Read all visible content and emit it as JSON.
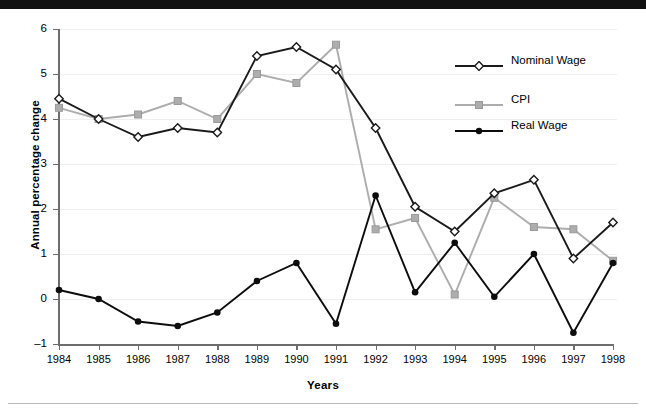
{
  "chart_data": {
    "type": "line",
    "title": "",
    "xlabel": "Years",
    "ylabel": "Annual percentage change",
    "grid": true,
    "legend_position": "top-right",
    "categories": [
      "1984",
      "1985",
      "1986",
      "1987",
      "1988",
      "1989",
      "1990",
      "1991",
      "1992",
      "1993",
      "1994",
      "1995",
      "1996",
      "1997",
      "1998"
    ],
    "x": [
      1984,
      1985,
      1986,
      1987,
      1988,
      1989,
      1990,
      1991,
      1992,
      1993,
      1994,
      1995,
      1996,
      1997,
      1998
    ],
    "xlim": [
      1984,
      1998
    ],
    "ylim": [
      -1,
      6
    ],
    "ytick_labels": [
      "6",
      "5",
      "4",
      "3",
      "2",
      "1",
      "0",
      "–1"
    ],
    "ytick_values": [
      6,
      5,
      4,
      3,
      2,
      1,
      0,
      -1
    ],
    "series": [
      {
        "name": "Nominal Wage",
        "marker": "diamond-open",
        "color": "#1a1a1a",
        "values": [
          4.45,
          4.0,
          3.6,
          3.8,
          3.7,
          5.4,
          5.6,
          5.1,
          3.8,
          2.05,
          1.5,
          2.35,
          2.65,
          0.9,
          1.7
        ]
      },
      {
        "name": "CPI",
        "marker": "square-filled",
        "color": "#adadad",
        "values": [
          4.25,
          4.0,
          4.1,
          4.4,
          4.0,
          5.0,
          4.8,
          5.65,
          1.55,
          1.8,
          0.1,
          2.25,
          1.6,
          1.55,
          0.85
        ]
      },
      {
        "name": "Real Wage",
        "marker": "circle-filled",
        "color": "#0d0d0d",
        "values": [
          0.2,
          0.0,
          -0.5,
          -0.6,
          -0.3,
          0.4,
          0.8,
          -0.55,
          2.3,
          0.15,
          1.25,
          0.05,
          1.0,
          -0.75,
          0.8
        ]
      }
    ]
  },
  "legend": {
    "items": [
      {
        "label": "Nominal Wage"
      },
      {
        "label": "CPI"
      },
      {
        "label": "Real Wage"
      }
    ]
  }
}
